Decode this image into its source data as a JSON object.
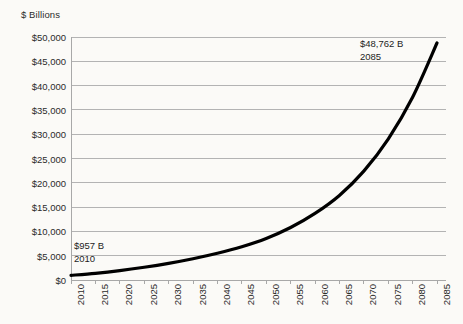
{
  "chart_data": {
    "type": "line",
    "title": "",
    "ylabel": "$ Billions",
    "xlabel": "",
    "ylim": [
      0,
      50000
    ],
    "xlim": [
      2010,
      2085
    ],
    "grid": true,
    "legend": "none",
    "line_color": "#000000",
    "grid_color": "#b3b3b3",
    "background": "#fbfaf7",
    "y_ticks": [
      "$50,000",
      "$45,000",
      "$40,000",
      "$35,000",
      "$30,000",
      "$25,000",
      "$20,000",
      "$15,000",
      "$10,000",
      "$5,000",
      "$0"
    ],
    "y_tick_values": [
      50000,
      45000,
      40000,
      35000,
      30000,
      25000,
      20000,
      15000,
      10000,
      5000,
      0
    ],
    "x_ticks": [
      "2010",
      "2015",
      "2020",
      "2025",
      "2030",
      "2035",
      "2040",
      "2045",
      "2050",
      "2055",
      "2060",
      "2065",
      "2070",
      "2075",
      "2080",
      "2085"
    ],
    "x": [
      2010,
      2015,
      2020,
      2025,
      2030,
      2035,
      2040,
      2045,
      2050,
      2055,
      2060,
      2065,
      2070,
      2075,
      2080,
      2085
    ],
    "values": [
      957,
      1380,
      1930,
      2620,
      3430,
      4380,
      5500,
      6850,
      8550,
      10800,
      13700,
      17400,
      22400,
      29000,
      37600,
      48762
    ],
    "annotations": [
      {
        "name": "start-point",
        "value_label": "$957 B",
        "year_label": "2010",
        "x": 2010,
        "y": 957
      },
      {
        "name": "end-point",
        "value_label": "$48,762 B",
        "year_label": "2085",
        "x": 2085,
        "y": 48762
      }
    ]
  }
}
